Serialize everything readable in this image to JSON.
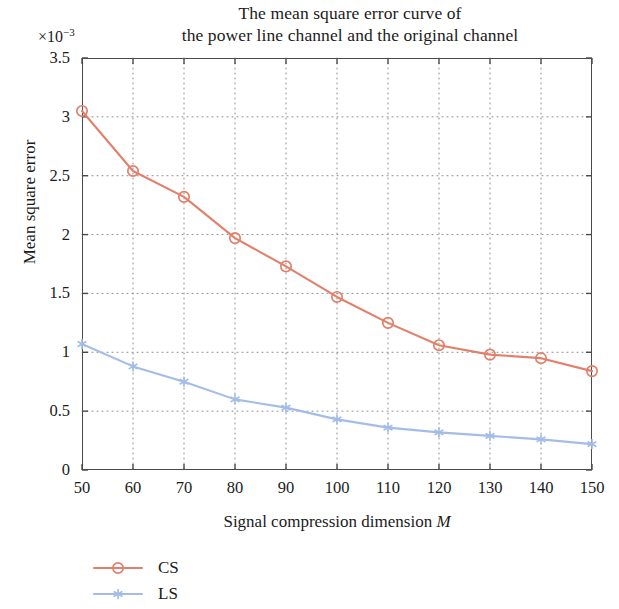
{
  "chart_data": {
    "type": "line",
    "title": "The mean square error curve of the power line channel and the original channel",
    "title_lines": [
      "The mean square error curve of",
      "the power line channel and the original channel"
    ],
    "xlabel": "Signal compression dimension M",
    "xlabel_plain": "Signal compression dimension",
    "xlabel_italic": "M",
    "ylabel": "Mean square error",
    "y_multiplier": "×10",
    "y_multiplier_exponent": "−3",
    "x": [
      50,
      60,
      70,
      80,
      90,
      100,
      110,
      120,
      130,
      140,
      150
    ],
    "xlim": [
      50,
      150
    ],
    "ylim": [
      0,
      3.5
    ],
    "xticks": [
      50,
      60,
      70,
      80,
      90,
      100,
      110,
      120,
      130,
      140,
      150
    ],
    "yticks": [
      0,
      0.5,
      1,
      1.5,
      2,
      2.5,
      3,
      3.5
    ],
    "xtick_labels": [
      "50",
      "60",
      "70",
      "80",
      "90",
      "100",
      "110",
      "120",
      "130",
      "140",
      "150"
    ],
    "ytick_labels": [
      "0",
      "0.5",
      "1",
      "1.5",
      "2",
      "2.5",
      "3",
      "3.5"
    ],
    "grid": true,
    "grid_style": "dotted",
    "grid_color": "#8c8c8c",
    "legend_position": "below-left",
    "series": [
      {
        "name": "CS",
        "color": "#e2806b",
        "marker": "circle-open",
        "values": [
          3.05,
          2.54,
          2.32,
          1.97,
          1.73,
          1.47,
          1.25,
          1.06,
          0.98,
          0.95,
          0.84
        ]
      },
      {
        "name": "LS",
        "color": "#a3bde8",
        "marker": "asterisk",
        "values": [
          1.07,
          0.88,
          0.75,
          0.6,
          0.53,
          0.43,
          0.36,
          0.32,
          0.29,
          0.26,
          0.22
        ]
      }
    ]
  },
  "legend": {
    "items": [
      {
        "label": "CS",
        "color": "#e2806b",
        "marker": "circle-open"
      },
      {
        "label": "LS",
        "color": "#a3bde8",
        "marker": "asterisk"
      }
    ]
  }
}
